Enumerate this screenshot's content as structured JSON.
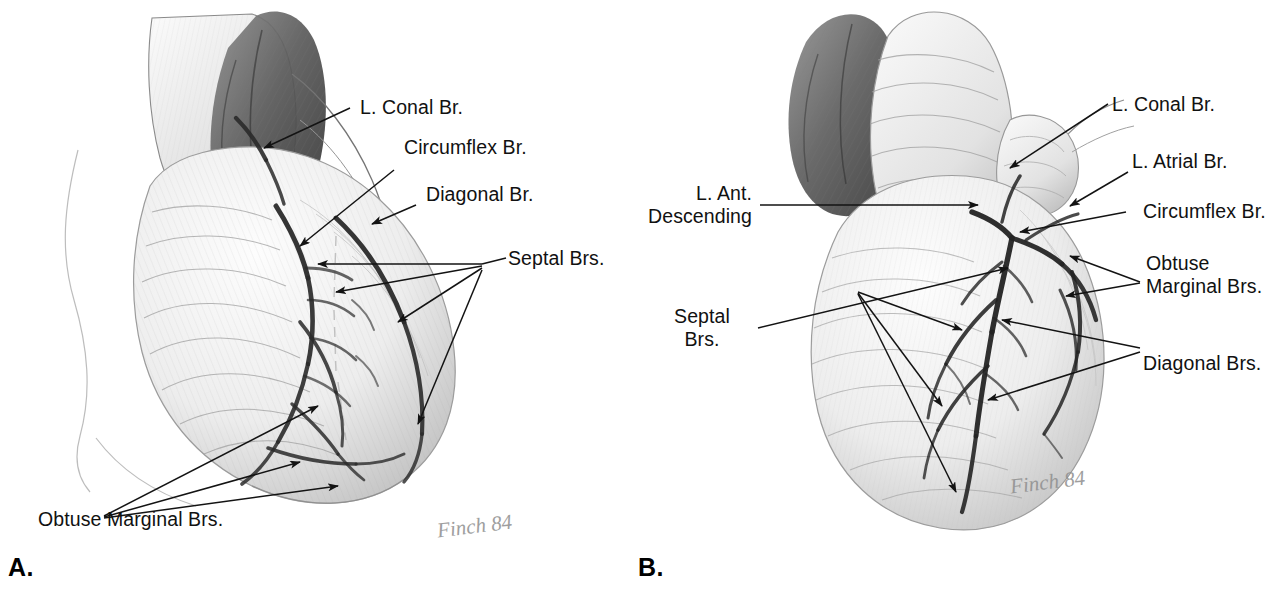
{
  "figure": {
    "background_color": "#ffffff",
    "ink_color": "#111111",
    "artist_signature": "Finch 84"
  },
  "panels": [
    {
      "letter": "A.",
      "view": "left anterior oblique / lateral view of the heart",
      "signature": "Finch 84",
      "labels": [
        {
          "id": "a-l-conal-br",
          "text": "L. Conal Br.",
          "align": "left"
        },
        {
          "id": "a-circumflex-br",
          "text": "Circumflex Br.",
          "align": "left"
        },
        {
          "id": "a-diagonal-br",
          "text": "Diagonal Br.",
          "align": "left"
        },
        {
          "id": "a-septal-brs",
          "text": "Septal Brs.",
          "align": "left"
        },
        {
          "id": "a-obtuse-marginal",
          "text": "Obtuse Marginal Brs.",
          "align": "left"
        }
      ]
    },
    {
      "letter": "B.",
      "view": "anterior view of the heart",
      "signature": "Finch 84",
      "labels": [
        {
          "id": "b-l-ant-descending",
          "text": "L. Ant.\nDescending",
          "align": "right"
        },
        {
          "id": "b-septal-brs",
          "text": "Septal\nBrs.",
          "align": "center"
        },
        {
          "id": "b-l-conal-br",
          "text": "L. Conal Br.",
          "align": "left"
        },
        {
          "id": "b-l-atrial-br",
          "text": "L. Atrial Br.",
          "align": "left"
        },
        {
          "id": "b-circumflex-br",
          "text": "Circumflex Br.",
          "align": "left"
        },
        {
          "id": "b-obtuse-marginal",
          "text": "Obtuse\nMarginal Brs.",
          "align": "left"
        },
        {
          "id": "b-diagonal-brs",
          "text": "Diagonal Brs.",
          "align": "left"
        }
      ]
    }
  ]
}
